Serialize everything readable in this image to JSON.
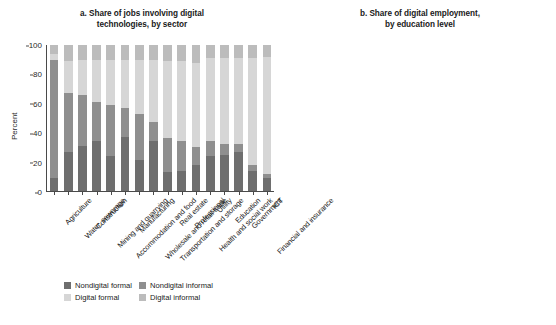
{
  "chart_data": [
    {
      "id": "a",
      "type": "bar",
      "title": "a. Share of jobs involving digital technologies, by sector",
      "title_lines": [
        "a. Share of jobs involving digital",
        "technologies, by sector"
      ],
      "xlabel": "",
      "ylabel": "Percent",
      "ylim": [
        0,
        100
      ],
      "yticks": [
        0,
        20,
        40,
        60,
        80,
        100
      ],
      "grid": false,
      "stacked": true,
      "stack_total": 100,
      "legend_position": "bottom",
      "categories": [
        "Agriculture",
        "Water, sewerage",
        "Construction",
        "Mining and quarrying",
        "Accommodation and food",
        "Manufacturing",
        "Wholesale and retail trade",
        "Transportation and storage",
        "Real estate",
        "Professional",
        "Health and social work",
        "Utility",
        "Education",
        "Government",
        "Financial and insurance",
        "ICT"
      ],
      "series": [
        {
          "name": "Nondigital formal",
          "color": "#6e6e6e",
          "values": [
            9,
            27,
            31,
            34,
            24,
            37,
            21,
            34,
            13,
            14,
            18,
            24,
            25,
            27,
            14,
            9
          ]
        },
        {
          "name": "Nondigital informal",
          "color": "#8f8f8f",
          "values": [
            81,
            40,
            35,
            27,
            35,
            20,
            32,
            13,
            23,
            20,
            12,
            10,
            7,
            5,
            4,
            3
          ]
        },
        {
          "name": "Digital formal",
          "color": "#d6d6d6",
          "values": [
            4,
            22,
            24,
            29,
            31,
            33,
            37,
            43,
            53,
            55,
            58,
            57,
            59,
            59,
            73,
            80
          ]
        },
        {
          "name": "Digital informal",
          "color": "#bcbcbc",
          "values": [
            6,
            11,
            10,
            10,
            10,
            10,
            10,
            10,
            11,
            11,
            12,
            9,
            9,
            9,
            9,
            8
          ]
        }
      ]
    },
    {
      "id": "b",
      "type": "bar",
      "title": "b. Share of digital employment, by education level",
      "title_lines": [
        "b. Share of digital employment,",
        "by education level"
      ],
      "xlabel": "",
      "ylabel": "Percent",
      "ylim": [
        0,
        100
      ],
      "yticks": [
        0,
        20,
        40,
        60,
        80,
        100
      ],
      "grid": false,
      "stacked": true,
      "stack_total": 100,
      "legend_position": "bottom",
      "categories": [
        "Digital formal",
        "Digital informal",
        "Nondigital formal",
        "Nondigital informal"
      ],
      "series": [
        {
          "name": "Primary or lower",
          "color": "#6e6e6e",
          "values": [
            10,
            24,
            41,
            64
          ]
        },
        {
          "name": "Lower secondary",
          "color": "#909090",
          "values": [
            12,
            25,
            21,
            18
          ]
        },
        {
          "name": "Upper secondary",
          "color": "#d2d2d2",
          "values": [
            50,
            46,
            35,
            17
          ]
        },
        {
          "name": "Diploma I/II/III",
          "color": "#bfbfbf",
          "values": [
            0,
            0,
            0,
            0
          ]
        },
        {
          "name": "University or higher",
          "color": "#1f1f1f",
          "values": [
            28,
            5,
            3,
            1
          ]
        }
      ]
    }
  ],
  "panel_a": {
    "title_line1": "a. Share of jobs involving digital",
    "title_line2": "technologies, by sector",
    "ylabel": "Percent",
    "yticks": [
      "100",
      "80",
      "60",
      "40",
      "20",
      "0"
    ],
    "legend": [
      {
        "label": "Nondigital formal",
        "color": "#6e6e6e"
      },
      {
        "label": "Nondigital informal",
        "color": "#8f8f8f"
      },
      {
        "label": "Digital formal",
        "color": "#d6d6d6"
      },
      {
        "label": "Digital informal",
        "color": "#bcbcbc"
      }
    ]
  },
  "panel_b": {
    "title_line1": "b. Share of digital employment,",
    "title_line2": "by education level",
    "ylabel": "Percent",
    "yticks": [
      "100",
      "80",
      "60",
      "40",
      "20",
      "0"
    ],
    "legend": [
      {
        "label": "Primary or lower",
        "color": "#6e6e6e"
      },
      {
        "label": "Lower secondary",
        "color": "#909090"
      },
      {
        "label": "Upper secondary",
        "color": "#d2d2d2"
      },
      {
        "label": "Diploma I/II/III",
        "color": "#bfbfbf"
      },
      {
        "label": "University or higher",
        "color": "#1f1f1f"
      }
    ]
  }
}
